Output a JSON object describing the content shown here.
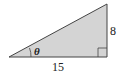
{
  "diagram": {
    "type": "right-triangle",
    "fill_color": "#d4d4d4",
    "stroke_color": "#444444",
    "vertices": {
      "left": [
        9,
        57
      ],
      "right_angle": [
        107,
        57
      ],
      "top": [
        107,
        4
      ]
    },
    "labels": {
      "angle": "θ",
      "base": "15",
      "height": "8"
    },
    "right_angle_marker": true
  }
}
